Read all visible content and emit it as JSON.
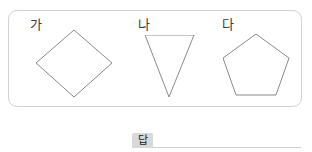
{
  "panel": {
    "shapes": [
      {
        "label": "가",
        "name": "rhombus",
        "shape_type": "rhombus",
        "sides": 4,
        "points": "38,0 76,33 38,67 0,33",
        "width": 77,
        "height": 68
      },
      {
        "label": "나",
        "name": "inverted-triangle",
        "shape_type": "triangle",
        "sides": 3,
        "points": "0,0 49,0 24,62",
        "width": 50,
        "height": 63
      },
      {
        "label": "다",
        "name": "pentagon",
        "shape_type": "pentagon",
        "sides": 5,
        "points": "33,0 66,24 53,61 13,61 0,24",
        "width": 67,
        "height": 62
      }
    ]
  },
  "answer": {
    "badge_label": "답",
    "value": "",
    "placeholder": ""
  },
  "colors": {
    "panel_border": "#d2d2d2",
    "shape_stroke": "#8a8a8a",
    "label_text": "#3a3a3a",
    "badge_background": "#d9d9d9",
    "answer_line": "#cfcfcf",
    "page_background": "#ffffff"
  }
}
